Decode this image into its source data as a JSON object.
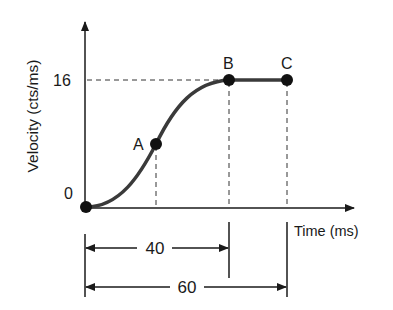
{
  "diagram": {
    "type": "velocity-time profile",
    "y_axis": {
      "label": "Velocity (cts/ms)",
      "ticks": [
        "0",
        "16"
      ]
    },
    "x_axis": {
      "label": "Time (ms)"
    },
    "points": [
      {
        "label": "A"
      },
      {
        "label": "B"
      },
      {
        "label": "C"
      }
    ],
    "dimensions": [
      {
        "label": "40"
      },
      {
        "label": "60"
      }
    ],
    "colors": {
      "curve": "#3a3a3a",
      "axis": "#1a1a1a",
      "dot": "#111111"
    }
  }
}
